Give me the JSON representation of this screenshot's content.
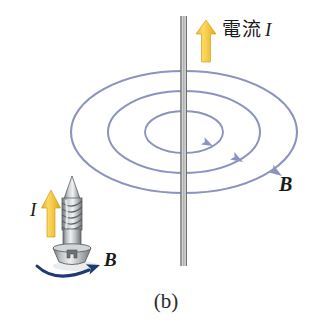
{
  "figure": {
    "panel_label": "(b)",
    "caption_language": "ja",
    "background_color": "#ffffff",
    "width": 332,
    "height": 333
  },
  "labels": {
    "current_text": "電流",
    "current_symbol": "I",
    "b_field_right": "B",
    "b_screw": "B",
    "i_screw": "I"
  },
  "colors": {
    "field_line": "#8b93bf",
    "field_line_dark": "#6e77a8",
    "current_arrow": "#f2c33c",
    "current_arrow_shadow": "#d9a81f",
    "wire_outline": "#5a5a5a",
    "wire_fill": "#bdbdbd",
    "screw_arrow": "#1f3a72",
    "screw_metal_light": "#e8e9ea",
    "screw_metal_mid": "#b3b6b8",
    "screw_metal_dark": "#7c8083",
    "text": "#1a1a1a"
  },
  "diagram": {
    "type": "physics-illustration",
    "wire": {
      "orientation": "vertical",
      "x": 184,
      "y_top": 16,
      "y_bottom": 266
    },
    "current_arrow": {
      "direction": "up",
      "x": 206,
      "y_tail": 62,
      "y_head": 22
    },
    "field_lines": [
      {
        "name": "outer-ellipse",
        "cx": 184,
        "cy": 132,
        "rx": 113,
        "ry": 61,
        "arrow_angle_deg": 28
      },
      {
        "name": "middle-ellipse",
        "cx": 184,
        "cy": 132,
        "rx": 76,
        "ry": 41,
        "arrow_angle_deg": 25
      },
      {
        "name": "inner-ellipse",
        "cx": 184,
        "cy": 132,
        "rx": 39,
        "ry": 21,
        "arrow_angle_deg": 22
      }
    ],
    "field_direction": "clockwise-viewed-from-above",
    "screw": {
      "cx": 72,
      "tip_y": 176,
      "head_y": 262,
      "type": "flat-head-wood-screw",
      "thread_turns": 8
    },
    "screw_current_arrow": {
      "direction": "up",
      "x": 51,
      "y_tail": 237,
      "y_head": 192
    },
    "screw_rotation_arrow": {
      "direction": "clockwise",
      "start_x": 38,
      "start_y": 268,
      "end_x": 100,
      "end_y": 263
    }
  }
}
